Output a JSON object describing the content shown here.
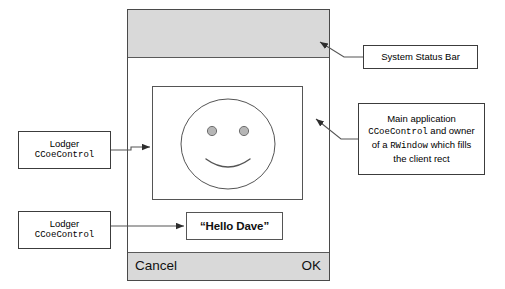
{
  "diagram": {
    "device": {
      "status_bar": {
        "name": "System status bar region",
        "fill": "#d9d9d9"
      },
      "smiley_lodger": {
        "name": "Smiley face lodger control"
      },
      "hello_lodger": {
        "text": "“Hello Dave”"
      },
      "cba_bar": {
        "left_label": "Cancel",
        "right_label": "OK",
        "fill": "#d9d9d9"
      }
    },
    "callouts": {
      "lodger_top": {
        "line1": "Lodger",
        "line2": "CCoeControl"
      },
      "lodger_bottom": {
        "line1": "Lodger",
        "line2": "CCoeControl"
      },
      "status_bar": {
        "line1": "System Status Bar"
      },
      "main_application": {
        "line1_a": "Main application",
        "line2_mono": "CCoeControl",
        "line2_b": " and owner",
        "line3_a": "of a ",
        "line3_mono": "RWindow",
        "line3_b": " which fills",
        "line4": "the client rect"
      }
    },
    "colors": {
      "frame_stroke": "#4a4a4a",
      "panel_stroke": "#555555",
      "callout_stroke": "#3c3c3c",
      "connector": "#555555",
      "eye_fill": "#b6b6b6",
      "bar_fill": "#d9d9d9"
    }
  }
}
